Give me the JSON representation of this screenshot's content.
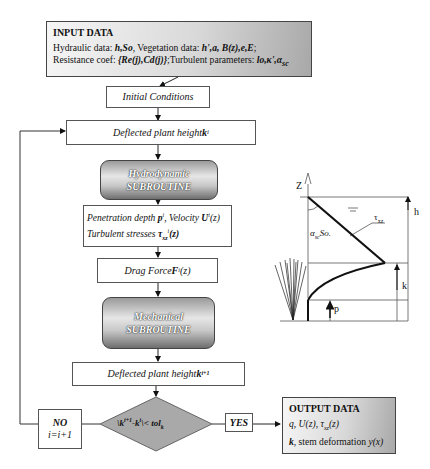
{
  "input": {
    "title": "INPUT DATA",
    "line1_prefix": "Hydraulic data: ",
    "line1_hyd": "h,So",
    "line1_mid": ", Vegetation data: ",
    "line1_veg": "h',a, B(z),e,E",
    "line1_end": ";",
    "line2_prefix": "Resistance coef: ",
    "line2_res": "{Re(j),Cd(j)}",
    "line2_mid": ";Turbulent parameters: ",
    "line2_turb": "lo,κ',α",
    "line2_sub": "sc"
  },
  "initial": {
    "label": "Initial Conditions"
  },
  "deflected1": {
    "label": "Deflected plant height ",
    "var": "k",
    "sup": "i"
  },
  "hydro": {
    "line1": "Hydrodynamic",
    "line2": "SUBROUTINE"
  },
  "penetration": {
    "l1a": "Penetration depth ",
    "l1b": "p",
    "l1c": "i",
    "l1d": ", Velocity ",
    "l1e": "U",
    "l1f": "i",
    "l1g": "(z)",
    "l2a": "Turbulent stresses ",
    "l2b": "τ",
    "l2c": "xz",
    "l2d": "i",
    "l2e": "(z)"
  },
  "drag": {
    "a": "Drag Force ",
    "b": "F",
    "c": "i",
    "d": "(z)"
  },
  "mech": {
    "line1": "Mechanical",
    "line2": "SUBROUTINE"
  },
  "deflected2": {
    "label": "Deflected plant height ",
    "var": "k",
    "sup": "i+1"
  },
  "decision": {
    "a": "\\k",
    "b": "i+1",
    "c": "-k",
    "d": "i",
    "e": "\\< tol",
    "f": "k"
  },
  "no": {
    "line1": "NO",
    "line2": "i=i+1"
  },
  "yes": {
    "label": "YES"
  },
  "output": {
    "title": "OUTPUT DATA",
    "line1a": "q, U(z), τ",
    "line1b": "xz",
    "line1c": "(z)",
    "line2a": "k",
    "line2b": ", stem deformation ",
    "line2c": "y(x)"
  },
  "profile": {
    "z_label": "Z",
    "h_label": "h",
    "k_label": "k",
    "p_label": "p",
    "tau_a": "τ",
    "tau_b": "xz",
    "alpha_a": "α",
    "alpha_b": "sc",
    "alpha_c": "So."
  }
}
